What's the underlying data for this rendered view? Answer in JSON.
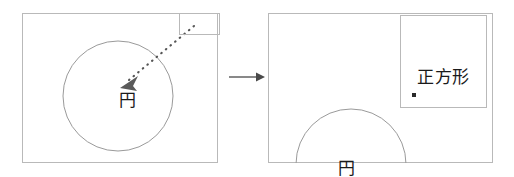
{
  "figure": {
    "type": "before-after-drag-diagram",
    "background_color": "#ffffff",
    "stroke_color": "#b9b9b9",
    "text_color": "#1a1a1a",
    "width": 514,
    "height": 177
  },
  "panel_before": {
    "name": "before-state-canvas",
    "shapes": {
      "circle": {
        "label": "円",
        "center_x": 117,
        "center_y": 95,
        "radius": 55
      },
      "square": {
        "label": "",
        "x": 178,
        "y": 13,
        "width": 40,
        "height": 21
      }
    },
    "drag_gesture": {
      "name": "drag-path",
      "style": "dotted",
      "start_x": 193,
      "start_y": 25,
      "end_x": 121,
      "end_y": 85,
      "arrowhead": "end"
    }
  },
  "transition": {
    "arrow_label": "",
    "direction": "right"
  },
  "panel_after": {
    "name": "after-state-canvas",
    "shapes": {
      "square": {
        "label": "正方形",
        "x": 400,
        "y": 15,
        "width": 86,
        "height": 92,
        "handle_dot": true
      },
      "circle": {
        "label": "円",
        "center_x": 350,
        "center_y": 163,
        "radius": 55,
        "clipped": "bottom"
      }
    }
  }
}
